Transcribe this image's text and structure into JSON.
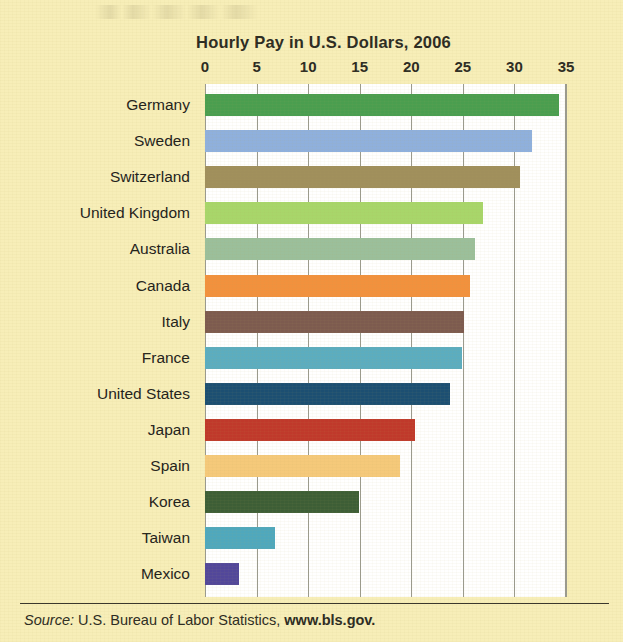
{
  "chart_data": {
    "type": "bar",
    "orientation": "horizontal",
    "title": "Hourly Pay in U.S. Dollars, 2006",
    "xlabel": "",
    "ylabel": "",
    "xlim": [
      0,
      35
    ],
    "xticks": [
      0,
      5,
      10,
      15,
      20,
      25,
      30,
      35
    ],
    "xtick_labels": [
      "0",
      "5",
      "10",
      "15",
      "20",
      "25",
      "30",
      "35"
    ],
    "grid": true,
    "grid_axis": "x",
    "legend": false,
    "categories": [
      "Germany",
      "Sweden",
      "Switzerland",
      "United Kingdom",
      "Australia",
      "Canada",
      "Italy",
      "France",
      "United States",
      "Japan",
      "Spain",
      "Korea",
      "Taiwan",
      "Mexico"
    ],
    "values": [
      34.3,
      31.7,
      30.5,
      27.0,
      26.2,
      25.7,
      25.1,
      24.9,
      23.8,
      20.4,
      18.9,
      14.9,
      6.8,
      3.3
    ],
    "bar_colors": [
      "#4a9e4f",
      "#8fb0dd",
      "#a08f5c",
      "#a8d66a",
      "#9bbf9b",
      "#f2913d",
      "#7d5b4f",
      "#5badc0",
      "#1c4f72",
      "#c0392b",
      "#f5c97a",
      "#3d5e36",
      "#4fa8bd",
      "#52479a"
    ],
    "background_color": "#f7eeb8",
    "plot_background_color": "#ffffff",
    "gridline_color": "#9a9a8e"
  },
  "source": {
    "prefix": "Source:",
    "body": "U.S. Bureau of Labor Statistics,",
    "url": "www.bls.gov."
  }
}
